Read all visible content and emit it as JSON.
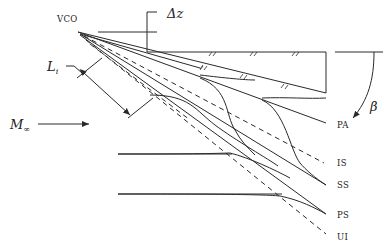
{
  "figure": {
    "type": "shock-interaction-schematic",
    "labels": {
      "vco": "VCO",
      "delta_z": "Δz",
      "length": "L",
      "length_sub": "i",
      "mach": "M",
      "mach_sub": "∞",
      "angle": "β"
    },
    "shock_labels": [
      {
        "id": "PA",
        "text": "PA",
        "style": "solid"
      },
      {
        "id": "IS",
        "text": "IS",
        "style": "dashed"
      },
      {
        "id": "SS",
        "text": "SS",
        "style": "solid"
      },
      {
        "id": "PS",
        "text": "PS",
        "style": "solid"
      },
      {
        "id": "UI",
        "text": "UI",
        "style": "dashed"
      }
    ],
    "colors": {
      "line": "#2a2a2a",
      "background": "#ffffff"
    }
  }
}
